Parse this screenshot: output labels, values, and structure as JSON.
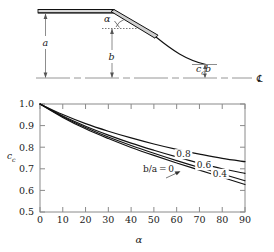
{
  "figure": {
    "title": "",
    "diagram": {
      "name": "gate-leaf-geometry-diagram",
      "labels": {
        "a": "a",
        "b": "b",
        "alpha": "α",
        "ccb": "ccb",
        "ccb_base": "c",
        "ccb_sub": "c",
        "ccb_tail": "b",
        "centerline_symbol": "℄"
      }
    },
    "chart_data": {
      "type": "line",
      "title": "",
      "xlabel": "α",
      "ylabel": "c_c",
      "ylabel_base": "c",
      "ylabel_sub": "c",
      "xlim": [
        0,
        90
      ],
      "ylim": [
        0.5,
        1.0
      ],
      "xticks": [
        0,
        10,
        20,
        30,
        40,
        50,
        60,
        70,
        80,
        90
      ],
      "xtick_labels": [
        "0",
        "10",
        "20",
        "30",
        "40",
        "50",
        "60",
        "70",
        "80",
        "90"
      ],
      "yticks": [
        0.5,
        0.6,
        0.7,
        0.8,
        0.9,
        1.0
      ],
      "ytick_labels": [
        "0.5",
        "0.6",
        "0.7",
        "0.8",
        "0.9",
        "1.0"
      ],
      "grid": false,
      "legend_position": "inline-curve-labels",
      "x": [
        0,
        10,
        20,
        30,
        40,
        50,
        60,
        70,
        80,
        90
      ],
      "series": [
        {
          "name": "b/a = 0",
          "label": "b/a = 0",
          "label_x": 52,
          "label_y": 0.695,
          "values": [
            1.0,
            0.938,
            0.885,
            0.84,
            0.799,
            0.762,
            0.727,
            0.694,
            0.661,
            0.627
          ]
        },
        {
          "name": "0.4",
          "label": "0.4",
          "label_x": 79,
          "label_y": 0.672,
          "values": [
            1.0,
            0.941,
            0.891,
            0.847,
            0.808,
            0.772,
            0.738,
            0.706,
            0.676,
            0.645
          ]
        },
        {
          "name": "0.6",
          "label": "0.6",
          "label_x": 72,
          "label_y": 0.712,
          "values": [
            1.0,
            0.944,
            0.897,
            0.856,
            0.819,
            0.786,
            0.755,
            0.726,
            0.7,
            0.679
          ]
        },
        {
          "name": "0.8",
          "label": "0.8",
          "label_x": 63,
          "label_y": 0.763,
          "values": [
            1.0,
            0.951,
            0.909,
            0.874,
            0.843,
            0.815,
            0.79,
            0.768,
            0.748,
            0.733
          ]
        }
      ]
    }
  }
}
